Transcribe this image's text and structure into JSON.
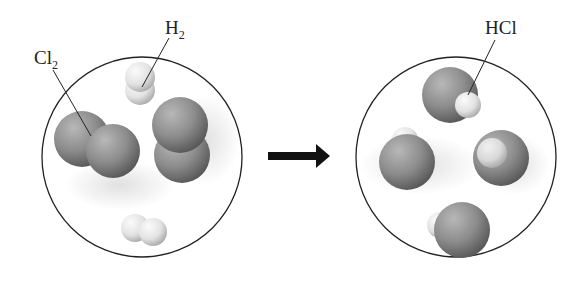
{
  "diagram": {
    "reactants": {
      "label_cl2": "Cl",
      "label_cl2_sub": "2",
      "label_h2": "H",
      "label_h2_sub": "2"
    },
    "products": {
      "label_hcl": "HCl"
    },
    "arrow": "reaction-arrow",
    "colors": {
      "chlorine": "#8a8a8a",
      "hydrogen": "#e4e4e4",
      "circle_border": "#222222",
      "arrow": "#111111"
    }
  }
}
